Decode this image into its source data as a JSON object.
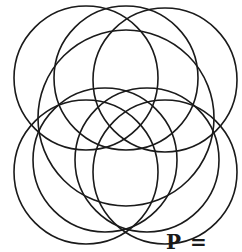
{
  "diagram": {
    "type": "overlapping-circles",
    "stroke_color": "#1a1a1a",
    "stroke_width": 1.6,
    "circles": [
      {
        "cx": 86,
        "cy": 78,
        "r": 72
      },
      {
        "cx": 126,
        "cy": 78,
        "r": 72
      },
      {
        "cx": 165,
        "cy": 80,
        "r": 72
      },
      {
        "cx": 126,
        "cy": 118,
        "r": 88
      },
      {
        "cx": 105,
        "cy": 160,
        "r": 72
      },
      {
        "cx": 147,
        "cy": 160,
        "r": 72
      },
      {
        "cx": 86,
        "cy": 172,
        "r": 72
      },
      {
        "cx": 165,
        "cy": 172,
        "r": 72
      }
    ]
  },
  "caption": "P ="
}
